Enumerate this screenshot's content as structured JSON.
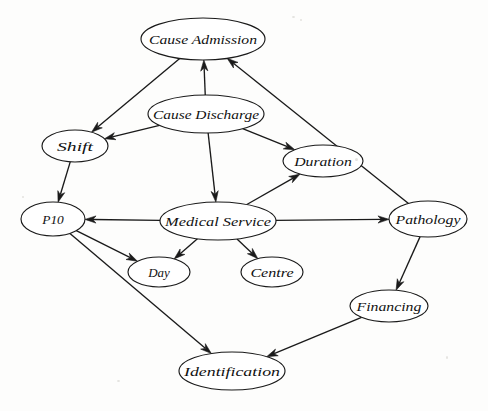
{
  "diagram": {
    "type": "directed-acyclic-graph",
    "background_color": "#fdfdfc",
    "node_fill": "#ffffff",
    "stroke_color": "#1a1a1a",
    "nodes": [
      {
        "id": "cause_admission",
        "label": "Cause Admission",
        "cx": 203,
        "cy": 39,
        "rx": 62,
        "ry": 21
      },
      {
        "id": "cause_discharge",
        "label": "Cause Discharge",
        "cx": 206,
        "cy": 114,
        "rx": 58,
        "ry": 19
      },
      {
        "id": "shift",
        "label": "Shift",
        "cx": 75,
        "cy": 146,
        "rx": 33,
        "ry": 16
      },
      {
        "id": "duration",
        "label": "Duration",
        "cx": 323,
        "cy": 161,
        "rx": 40,
        "ry": 16
      },
      {
        "id": "p10",
        "label": "P10",
        "cx": 53,
        "cy": 219,
        "rx": 32,
        "ry": 17
      },
      {
        "id": "medical_service",
        "label": "Medical Service",
        "cx": 218,
        "cy": 221,
        "rx": 58,
        "ry": 19
      },
      {
        "id": "pathology",
        "label": "Pathology",
        "cx": 428,
        "cy": 219,
        "rx": 39,
        "ry": 18
      },
      {
        "id": "day",
        "label": "Day",
        "cx": 159,
        "cy": 272,
        "rx": 31,
        "ry": 15
      },
      {
        "id": "centre",
        "label": "Centre",
        "cx": 272,
        "cy": 272,
        "rx": 31,
        "ry": 15
      },
      {
        "id": "financing",
        "label": "Financing",
        "cx": 389,
        "cy": 306,
        "rx": 39,
        "ry": 16
      },
      {
        "id": "identification",
        "label": "Identification",
        "cx": 232,
        "cy": 371,
        "rx": 53,
        "ry": 19
      }
    ],
    "edges": [
      {
        "from": "cause_admission",
        "to": "shift",
        "label": ""
      },
      {
        "from": "cause_discharge",
        "to": "cause_admission",
        "label": ""
      },
      {
        "from": "cause_discharge",
        "to": "shift",
        "label": ""
      },
      {
        "from": "cause_discharge",
        "to": "duration",
        "label": ""
      },
      {
        "from": "cause_discharge",
        "to": "medical_service",
        "label": ""
      },
      {
        "from": "shift",
        "to": "p10",
        "label": ""
      },
      {
        "from": "medical_service",
        "to": "p10",
        "label": ""
      },
      {
        "from": "medical_service",
        "to": "duration",
        "label": ""
      },
      {
        "from": "medical_service",
        "to": "day",
        "label": ""
      },
      {
        "from": "medical_service",
        "to": "centre",
        "label": ""
      },
      {
        "from": "medical_service",
        "to": "pathology",
        "label": ""
      },
      {
        "from": "pathology",
        "to": "cause_admission",
        "label": ""
      },
      {
        "from": "pathology",
        "to": "financing",
        "label": ""
      },
      {
        "from": "p10",
        "to": "day",
        "label": ""
      },
      {
        "from": "p10",
        "to": "identification",
        "label": ""
      },
      {
        "from": "financing",
        "to": "identification",
        "label": ""
      }
    ]
  }
}
